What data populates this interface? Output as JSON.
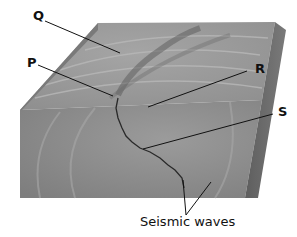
{
  "figure": {
    "colors": {
      "top_surface": "#9a9a9a",
      "front_face": "#8a8a8a",
      "side_face": "#6a6a6a",
      "left_edge": "#7a7a7a",
      "fault_line": "#2a2a2a",
      "leader_line": "#111111"
    }
  },
  "labels": {
    "Q": "Q",
    "P": "P",
    "R": "R",
    "S": "S",
    "caption": "Seismic waves"
  }
}
